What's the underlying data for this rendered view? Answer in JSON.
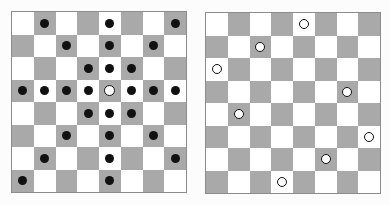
{
  "figure": {
    "background_color": "#fcfcfc",
    "board_count": 2
  },
  "style": {
    "light_square_color": "#ffffff",
    "dark_square_color": "#a9a9a9",
    "border_color": "#8c8c8c",
    "marker_dot_color": "#111111",
    "queen_ring_color": "#111111",
    "queen_fill_color": "#ffffff"
  },
  "boards": [
    {
      "id": "board-left",
      "name": "queen-attack-board",
      "rows": 8,
      "cols": 8,
      "light_parity": "even",
      "queens": [
        {
          "row": 3,
          "col": 4,
          "marker": "queen"
        }
      ],
      "attacked": [
        {
          "row": 0,
          "col": 1
        },
        {
          "row": 0,
          "col": 4
        },
        {
          "row": 0,
          "col": 7
        },
        {
          "row": 1,
          "col": 2
        },
        {
          "row": 1,
          "col": 4
        },
        {
          "row": 1,
          "col": 6
        },
        {
          "row": 2,
          "col": 3
        },
        {
          "row": 2,
          "col": 4
        },
        {
          "row": 2,
          "col": 5
        },
        {
          "row": 3,
          "col": 0
        },
        {
          "row": 3,
          "col": 1
        },
        {
          "row": 3,
          "col": 2
        },
        {
          "row": 3,
          "col": 3
        },
        {
          "row": 3,
          "col": 5
        },
        {
          "row": 3,
          "col": 6
        },
        {
          "row": 3,
          "col": 7
        },
        {
          "row": 4,
          "col": 3
        },
        {
          "row": 4,
          "col": 4
        },
        {
          "row": 4,
          "col": 5
        },
        {
          "row": 5,
          "col": 2
        },
        {
          "row": 5,
          "col": 4
        },
        {
          "row": 5,
          "col": 6
        },
        {
          "row": 6,
          "col": 1
        },
        {
          "row": 6,
          "col": 4
        },
        {
          "row": 6,
          "col": 7
        },
        {
          "row": 7,
          "col": 0
        },
        {
          "row": 7,
          "col": 4
        }
      ]
    },
    {
      "id": "board-right",
      "name": "eight-queens-solution-board",
      "rows": 8,
      "cols": 8,
      "light_parity": "even",
      "queens": [
        {
          "row": 0,
          "col": 4,
          "marker": "queen"
        },
        {
          "row": 1,
          "col": 2,
          "marker": "queen"
        },
        {
          "row": 2,
          "col": 0,
          "marker": "queen"
        },
        {
          "row": 3,
          "col": 6,
          "marker": "queen"
        },
        {
          "row": 4,
          "col": 1,
          "marker": "queen"
        },
        {
          "row": 5,
          "col": 7,
          "marker": "queen"
        },
        {
          "row": 6,
          "col": 5,
          "marker": "queen"
        },
        {
          "row": 7,
          "col": 3,
          "marker": "queen"
        }
      ],
      "attacked": []
    }
  ]
}
